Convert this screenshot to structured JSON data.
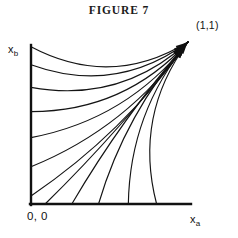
{
  "figure": {
    "title": "FIGURE 7",
    "axis_x_label": "x",
    "axis_x_subscript": "a",
    "axis_y_label": "x",
    "axis_y_subscript": "b",
    "origin_label": "0, 0",
    "corner_label": "(1,1)",
    "line_color": "#111111",
    "background_color": "#ffffff"
  },
  "chart_data": {
    "type": "line",
    "title": "FIGURE 7",
    "xlabel": "x_a",
    "ylabel": "x_b",
    "xlim": [
      0,
      1
    ],
    "ylim": [
      0,
      1
    ],
    "grid": false,
    "legend": "none",
    "annotations": [
      {
        "text": "(1,1)",
        "x": 1.0,
        "y": 1.0,
        "placement": "above-right"
      },
      {
        "text": "0, 0",
        "x": 0.0,
        "y": 0.0,
        "placement": "below-left"
      }
    ],
    "attractor": {
      "x": 1.0,
      "y": 1.0,
      "arrowheads": 12
    },
    "series": [
      {
        "name": "trajectory-1",
        "start": [
          0.0,
          0.97
        ],
        "end": [
          1.0,
          1.0
        ],
        "bow": 0.62
      },
      {
        "name": "trajectory-2",
        "start": [
          0.0,
          0.86
        ],
        "end": [
          1.0,
          1.0
        ],
        "bow": 0.58
      },
      {
        "name": "trajectory-3",
        "start": [
          0.0,
          0.72
        ],
        "end": [
          1.0,
          1.0
        ],
        "bow": 0.54
      },
      {
        "name": "trajectory-4",
        "start": [
          0.0,
          0.57
        ],
        "end": [
          1.0,
          1.0
        ],
        "bow": 0.48
      },
      {
        "name": "trajectory-5",
        "start": [
          0.0,
          0.41
        ],
        "end": [
          1.0,
          1.0
        ],
        "bow": 0.41
      },
      {
        "name": "trajectory-6",
        "start": [
          0.0,
          0.23
        ],
        "end": [
          1.0,
          1.0
        ],
        "bow": 0.32
      },
      {
        "name": "trajectory-7",
        "start": [
          0.0,
          0.05
        ],
        "end": [
          1.0,
          1.0
        ],
        "bow": 0.2
      },
      {
        "name": "trajectory-8",
        "start": [
          0.09,
          0.0
        ],
        "end": [
          1.0,
          1.0
        ],
        "bow": 0.08
      },
      {
        "name": "trajectory-9",
        "start": [
          0.26,
          0.0
        ],
        "end": [
          1.0,
          1.0
        ],
        "bow": -0.1
      },
      {
        "name": "trajectory-10",
        "start": [
          0.43,
          0.0
        ],
        "end": [
          1.0,
          1.0
        ],
        "bow": -0.24
      },
      {
        "name": "trajectory-11",
        "start": [
          0.62,
          0.0
        ],
        "end": [
          1.0,
          1.0
        ],
        "bow": -0.38
      },
      {
        "name": "trajectory-12",
        "start": [
          0.8,
          0.0
        ],
        "end": [
          1.0,
          1.0
        ],
        "bow": -0.52
      }
    ]
  }
}
